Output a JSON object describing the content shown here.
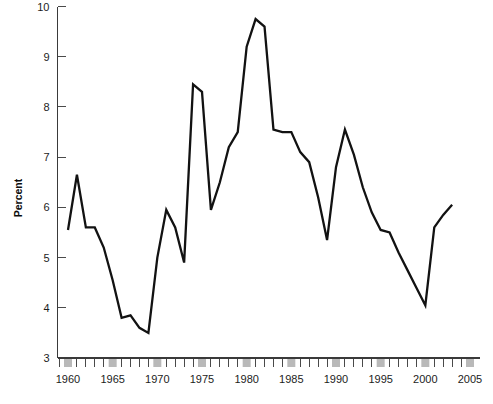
{
  "chart_data": {
    "type": "line",
    "title": "",
    "subtitle": "",
    "xlabel": "",
    "ylabel": "Percent",
    "xlim": [
      1958.8,
      2005.6
    ],
    "ylim": [
      3,
      10
    ],
    "grid": false,
    "legend": null,
    "y_ticks": [
      3,
      4,
      5,
      6,
      7,
      8,
      9,
      10
    ],
    "y_tick_labels": [
      "3",
      "4",
      "5",
      "6",
      "7",
      "8",
      "9",
      "10"
    ],
    "x_ticks": [
      1959,
      1960,
      1961,
      1962,
      1963,
      1964,
      1965,
      1966,
      1967,
      1968,
      1969,
      1970,
      1971,
      1972,
      1973,
      1974,
      1975,
      1976,
      1977,
      1978,
      1979,
      1980,
      1981,
      1982,
      1983,
      1984,
      1985,
      1986,
      1987,
      1988,
      1989,
      1990,
      1991,
      1992,
      1993,
      1994,
      1995,
      1996,
      1997,
      1998,
      1999,
      2000,
      2001,
      2002,
      2003,
      2004,
      2005
    ],
    "x_labeled_ticks": [
      1960,
      1965,
      1970,
      1975,
      1980,
      1985,
      1990,
      1995,
      2000,
      2005
    ],
    "x_tick_labels": [
      "1960",
      "1965",
      "1970",
      "1975",
      "1980",
      "1985",
      "1990",
      "1995",
      "2000",
      "2005"
    ],
    "highlighted_ticks": [
      1960,
      1965,
      1970,
      1975,
      1980,
      1985,
      1990,
      1995,
      2000,
      2005
    ],
    "series": [
      {
        "name": "Percent",
        "color": "#121212",
        "x": [
          1960,
          1961,
          1962,
          1963,
          1964,
          1965,
          1966,
          1967,
          1968,
          1969,
          1970,
          1971,
          1972,
          1973,
          1974,
          1975,
          1976,
          1977,
          1978,
          1979,
          1980,
          1981,
          1982,
          1983,
          1984,
          1985,
          1986,
          1987,
          1988,
          1989,
          1990,
          1991,
          1992,
          1993,
          1994,
          1995,
          1996,
          1997,
          1998,
          1999,
          2000,
          2001,
          2002,
          2003
        ],
        "values": [
          5.55,
          6.65,
          5.6,
          5.6,
          5.2,
          4.55,
          3.8,
          3.85,
          3.6,
          3.5,
          5.0,
          5.95,
          5.6,
          4.9,
          8.45,
          8.3,
          5.95,
          6.5,
          7.2,
          7.5,
          9.2,
          9.75,
          9.6,
          7.55,
          7.5,
          7.5,
          7.1,
          6.9,
          6.2,
          5.35,
          6.8,
          7.55,
          7.05,
          6.4,
          5.9,
          5.55,
          5.5,
          5.1,
          4.75,
          4.4,
          4.05,
          5.6,
          5.85,
          6.05
        ]
      }
    ]
  },
  "axis": {
    "y_label": "Percent"
  }
}
